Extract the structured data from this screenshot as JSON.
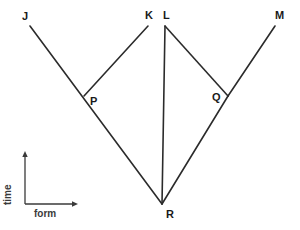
{
  "figure": {
    "background_color": "#ffffff",
    "stroke_color": "#2b2b2b",
    "label_color": "#1a1a1a",
    "axis_color": "#3a3a3a"
  },
  "axes": {
    "vertical": {
      "label": "time"
    },
    "horizontal": {
      "label": "form"
    }
  },
  "nodes": [
    {
      "id": "J",
      "label": "J",
      "label_x": 22,
      "label_y": 11
    },
    {
      "id": "K",
      "label": "K",
      "label_x": 145,
      "label_y": 10
    },
    {
      "id": "L",
      "label": "L",
      "label_x": 163,
      "label_y": 10
    },
    {
      "id": "M",
      "label": "M",
      "label_x": 275,
      "label_y": 10
    },
    {
      "id": "P",
      "label": "P",
      "label_x": 90,
      "label_y": 96
    },
    {
      "id": "Q",
      "label": "Q",
      "label_x": 212,
      "label_y": 92
    },
    {
      "id": "R",
      "label": "R",
      "label_x": 166,
      "label_y": 209
    }
  ],
  "edges": [
    {
      "id": "J-R",
      "from": "J",
      "to": "R",
      "x1": 30,
      "y1": 26,
      "x2": 162,
      "y2": 204
    },
    {
      "id": "K-P",
      "from": "K",
      "to": "P",
      "x1": 148,
      "y1": 26,
      "x2": 84,
      "y2": 96
    },
    {
      "id": "L-R",
      "from": "L",
      "to": "R",
      "x1": 165,
      "y1": 26,
      "x2": 162,
      "y2": 204
    },
    {
      "id": "M-Q",
      "from": "M",
      "to": "Q",
      "x1": 275,
      "y1": 26,
      "x2": 228,
      "y2": 96
    }
  ]
}
